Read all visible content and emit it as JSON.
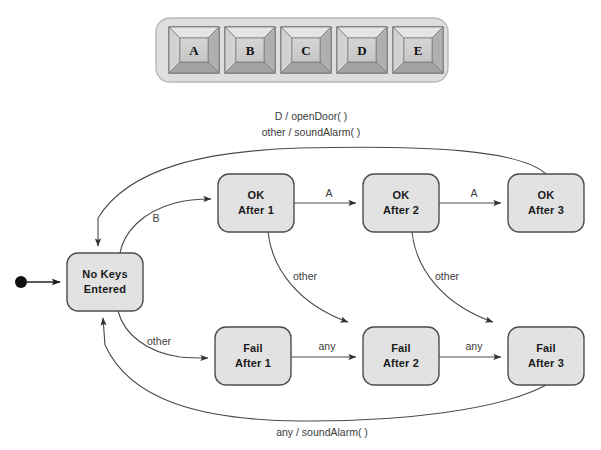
{
  "figure": {
    "colors": {
      "state_fill": "#e2e2e2",
      "state_stroke": "#4d4d4d",
      "edge_stroke": "#4a4a4a",
      "keypad_body": "#dcdcdc",
      "key_face": "#cfcfcf",
      "background": "#ffffff"
    }
  },
  "keypad": {
    "name": "keypad",
    "keys": [
      {
        "label": "A"
      },
      {
        "label": "B"
      },
      {
        "label": "C"
      },
      {
        "label": "D"
      },
      {
        "label": "E"
      }
    ]
  },
  "statechart": {
    "initial_marker": "filled-circle",
    "states": [
      {
        "id": "no-keys",
        "line1": "No Keys",
        "line2": "Entered",
        "x": 67,
        "y": 253,
        "w": 76,
        "h": 58
      },
      {
        "id": "ok1",
        "line1": "OK",
        "line2": "After 1",
        "x": 218,
        "y": 174,
        "w": 76,
        "h": 58
      },
      {
        "id": "ok2",
        "line1": "OK",
        "line2": "After 2",
        "x": 363,
        "y": 174,
        "w": 76,
        "h": 58
      },
      {
        "id": "ok3",
        "line1": "OK",
        "line2": "After 3",
        "x": 508,
        "y": 174,
        "w": 76,
        "h": 58
      },
      {
        "id": "fail1",
        "line1": "Fail",
        "line2": "After 1",
        "x": 215,
        "y": 327,
        "w": 76,
        "h": 58
      },
      {
        "id": "fail2",
        "line1": "Fail",
        "line2": "After 2",
        "x": 363,
        "y": 327,
        "w": 76,
        "h": 58
      },
      {
        "id": "fail3",
        "line1": "Fail",
        "line2": "After 3",
        "x": 508,
        "y": 327,
        "w": 76,
        "h": 58
      }
    ],
    "transitions": [
      {
        "id": "t-top-1",
        "label": "D / openDoor( )",
        "from": "ok3",
        "to": "no-keys",
        "x": 311,
        "y": 120
      },
      {
        "id": "t-top-2",
        "label": "other / soundAlarm( )",
        "from": "ok3",
        "to": "no-keys",
        "x": 311,
        "y": 136
      },
      {
        "id": "t-b",
        "label": "B",
        "from": "no-keys",
        "to": "ok1",
        "x": 156,
        "y": 222
      },
      {
        "id": "t-ok1-ok2",
        "label": "A",
        "from": "ok1",
        "to": "ok2",
        "x": 329,
        "y": 197
      },
      {
        "id": "t-ok2-ok3",
        "label": "A",
        "from": "ok2",
        "to": "ok3",
        "x": 474,
        "y": 197
      },
      {
        "id": "t-other-1",
        "label": "other",
        "from": "ok1",
        "to": "fail2",
        "x": 305,
        "y": 280
      },
      {
        "id": "t-other-2",
        "label": "other",
        "from": "ok2",
        "to": "fail3",
        "x": 447,
        "y": 280
      },
      {
        "id": "t-other-f1",
        "label": "other",
        "from": "no-keys",
        "to": "fail1",
        "x": 159,
        "y": 345
      },
      {
        "id": "t-f1-f2",
        "label": "any",
        "from": "fail1",
        "to": "fail2",
        "x": 327,
        "y": 350
      },
      {
        "id": "t-f2-f3",
        "label": "any",
        "from": "fail2",
        "to": "fail3",
        "x": 474,
        "y": 350
      },
      {
        "id": "t-bottom",
        "label": "any / soundAlarm( )",
        "from": "fail3",
        "to": "no-keys",
        "x": 322,
        "y": 436
      }
    ]
  }
}
